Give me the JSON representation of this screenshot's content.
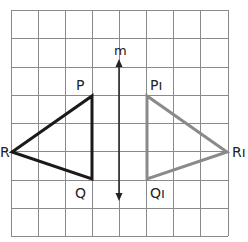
{
  "figure": {
    "type": "reflection diagram",
    "grid": {
      "cols": 8,
      "rows": 8
    },
    "mirror_line": {
      "label": "m"
    },
    "original": {
      "color": "#1a1a1a",
      "vertices": {
        "P": "P",
        "Q": "Q",
        "R": "R"
      }
    },
    "image": {
      "color": "#8a8a8a",
      "vertices": {
        "P": "Pı",
        "Q": "Qı",
        "R": "Rı"
      }
    }
  }
}
